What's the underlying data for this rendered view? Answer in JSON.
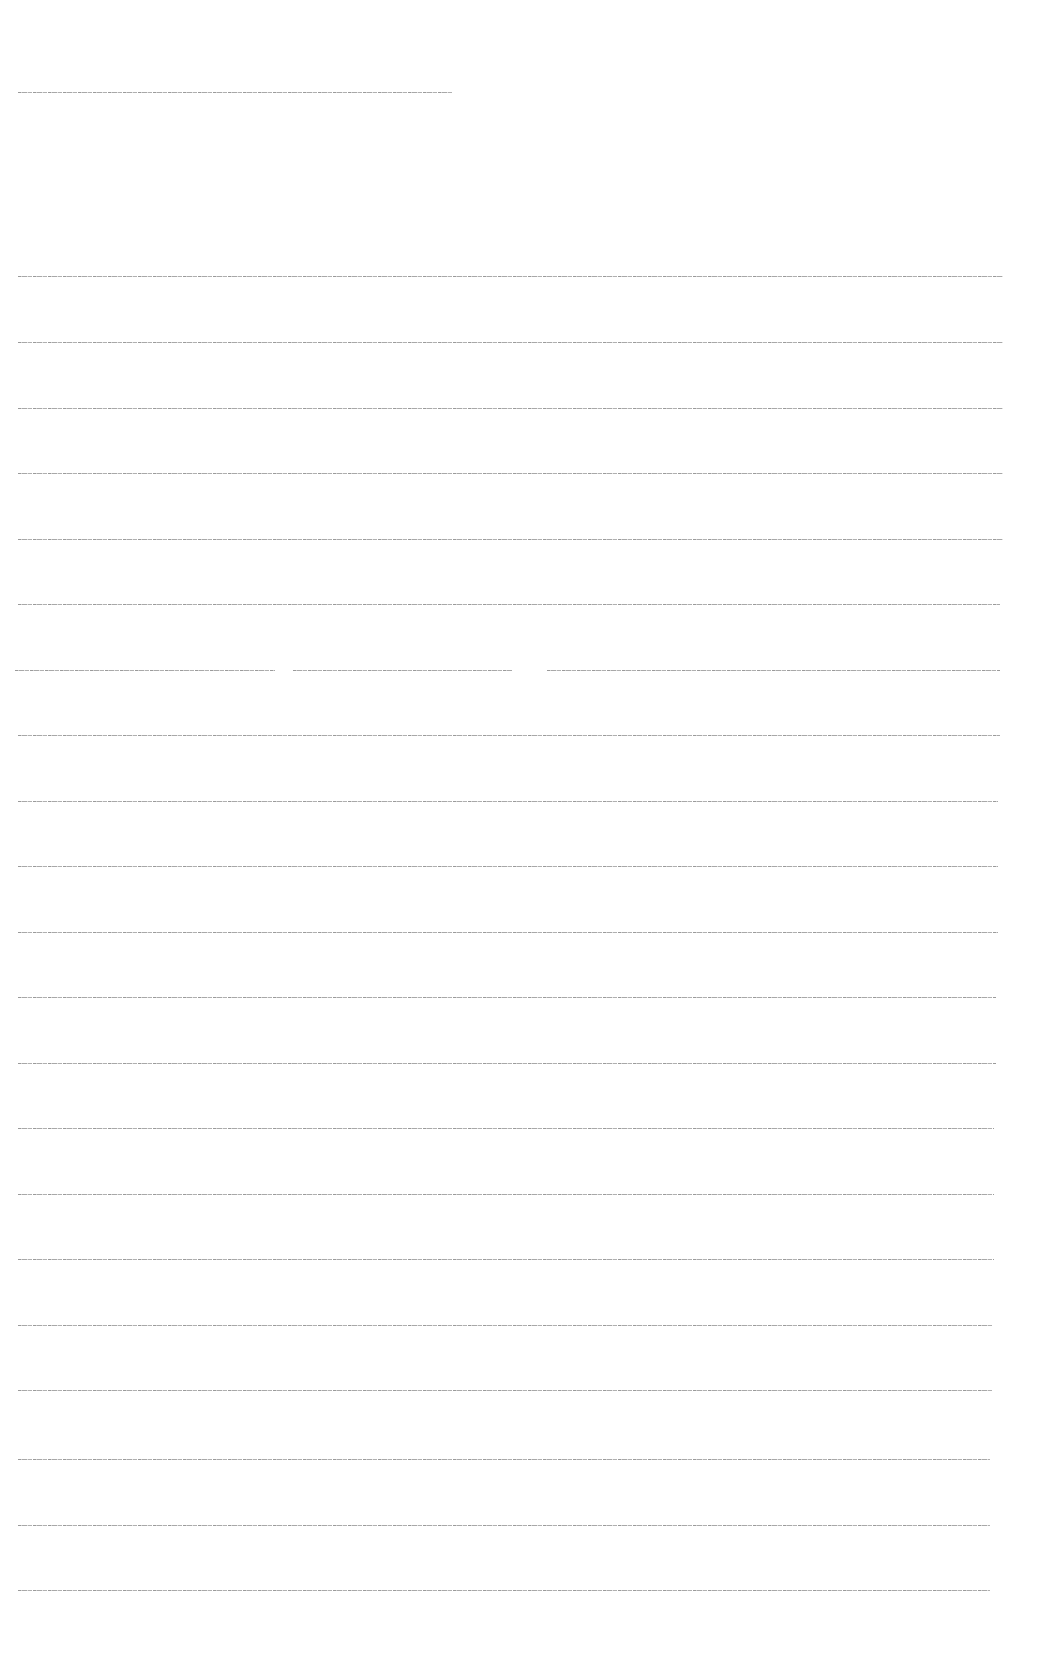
{
  "document": {
    "header": {
      "text": "[illegible header text line]",
      "y": 92,
      "x_start": 18,
      "x_end": 452
    },
    "lines": [
      {
        "y": 276,
        "x_end": 1003,
        "text": "[illegible text line 1]"
      },
      {
        "y": 342,
        "x_end": 1003,
        "text": "[illegible text line 2]"
      },
      {
        "y": 408,
        "x_end": 1003,
        "text": "[illegible text line 3]"
      },
      {
        "y": 473,
        "x_end": 1003,
        "text": "[illegible text line 4]"
      },
      {
        "y": 539,
        "x_end": 1003,
        "text": "[illegible text line 5]"
      },
      {
        "y": 604,
        "x_end": 1000,
        "text": "[illegible text line 6]"
      },
      {
        "y": 670,
        "x_end": 1000,
        "text": "[illegible text line 7]",
        "segments": [
          {
            "x_start": 15,
            "x_end": 275,
            "text": "[illegible segment a]"
          },
          {
            "x_start": 293,
            "x_end": 512,
            "text": "[illegible segment b]"
          },
          {
            "x_start": 547,
            "x_end": 1000,
            "text": "[illegible segment c]"
          }
        ]
      },
      {
        "y": 735,
        "x_end": 1000,
        "text": "[illegible text line 8]"
      },
      {
        "y": 801,
        "x_end": 998,
        "text": "[illegible text line 9]"
      },
      {
        "y": 866,
        "x_end": 998,
        "text": "[illegible text line 10]"
      },
      {
        "y": 932,
        "x_end": 998,
        "text": "[illegible text line 11]"
      },
      {
        "y": 997,
        "x_end": 996,
        "text": "[illegible text line 12]"
      },
      {
        "y": 1063,
        "x_end": 996,
        "text": "[illegible text line 13]"
      },
      {
        "y": 1128,
        "x_end": 994,
        "text": "[illegible text line 14]"
      },
      {
        "y": 1194,
        "x_end": 994,
        "text": "[illegible text line 15]"
      },
      {
        "y": 1259,
        "x_end": 994,
        "text": "[illegible text line 16]"
      },
      {
        "y": 1325,
        "x_end": 992,
        "text": "[illegible text line 17]"
      },
      {
        "y": 1390,
        "x_end": 992,
        "text": "[illegible text line 18]"
      },
      {
        "y": 1459,
        "x_end": 990,
        "text": "[illegible text line 19]"
      },
      {
        "y": 1525,
        "x_end": 990,
        "text": "[illegible text line 20]"
      },
      {
        "y": 1590,
        "x_end": 990,
        "text": "[illegible text line 21]"
      }
    ]
  },
  "colors": {
    "background": "#ffffff",
    "text": "#9a9a9a"
  }
}
